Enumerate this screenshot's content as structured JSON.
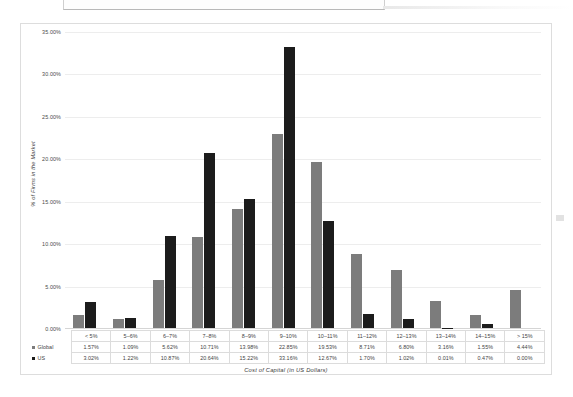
{
  "chart_data": {
    "type": "bar",
    "title": "",
    "xlabel": "Cost of Capital (in US Dollars)",
    "ylabel": "% of Firms in the Market",
    "ylim": [
      0,
      35
    ],
    "ytick_labels": [
      "35.00%",
      "30.00%",
      "25.00%",
      "20.00%",
      "15.00%",
      "10.00%",
      "5.00%",
      "0.00%"
    ],
    "ytick_values": [
      35,
      30,
      25,
      20,
      15,
      10,
      5,
      0
    ],
    "grid": true,
    "legend_position": "bottom-table",
    "categories": [
      "< 5%",
      "5–6%",
      "6–7%",
      "7–8%",
      "8–9%",
      "9–10%",
      "10–11%",
      "11–12%",
      "12–13%",
      "13–14%",
      "14–15%",
      "> 15%"
    ],
    "series": [
      {
        "name": "Global",
        "color": "#7c7c7c",
        "values": [
          1.57,
          1.09,
          5.62,
          10.71,
          13.98,
          22.85,
          19.53,
          8.71,
          6.8,
          3.16,
          1.55,
          4.44
        ],
        "labels": [
          "1.57%",
          "1.09%",
          "5.62%",
          "10.71%",
          "13.98%",
          "22.85%",
          "19.53%",
          "8.71%",
          "6.80%",
          "3.16%",
          "1.55%",
          "4.44%"
        ]
      },
      {
        "name": "US",
        "color": "#1c1c1c",
        "values": [
          3.02,
          1.22,
          10.87,
          20.64,
          15.22,
          33.16,
          12.67,
          1.7,
          1.02,
          0.01,
          0.47,
          0.0
        ],
        "labels": [
          "3.02%",
          "1.22%",
          "10.87%",
          "20.64%",
          "15.22%",
          "33.16%",
          "12.67%",
          "1.70%",
          "1.02%",
          "0.01%",
          "0.47%",
          "0.00%"
        ]
      }
    ]
  }
}
